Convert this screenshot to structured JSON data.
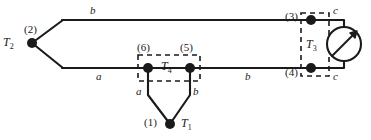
{
  "figure": {
    "width": 371,
    "height": 140,
    "colors": {
      "wire": "#1a1a1a",
      "dashed_box": "#1a1a1a",
      "node": "#1a1a1a",
      "background": "#ffffff"
    }
  },
  "nodes": [
    {
      "id": "n1",
      "number": "(1)",
      "temperature": "T",
      "temperature_sub": "1",
      "x": 170,
      "y": 124
    },
    {
      "id": "n2",
      "number": "(2)",
      "temperature": "T",
      "temperature_sub": "2",
      "x": 32,
      "y": 43
    },
    {
      "id": "n3",
      "number": "(3)",
      "temperature": "",
      "temperature_sub": "",
      "x": 311,
      "y": 20
    },
    {
      "id": "n4",
      "number": "(4)",
      "temperature": "",
      "temperature_sub": "",
      "x": 311,
      "y": 68
    },
    {
      "id": "n5",
      "number": "(5)",
      "temperature": "",
      "temperature_sub": "",
      "x": 190,
      "y": 68
    },
    {
      "id": "n6",
      "number": "(6)",
      "temperature": "",
      "temperature_sub": "",
      "x": 148,
      "y": 68
    }
  ],
  "node_labels": {
    "n1": "(1)",
    "n2": "(2)",
    "n3": "(3)",
    "n4": "(4)",
    "n5": "(5)",
    "n6": "(6)"
  },
  "temperature_labels": {
    "T1": "T",
    "T1_sub": "1",
    "T2": "T",
    "T2_sub": "2",
    "T3": "T",
    "T3_sub": "3",
    "T4": "T",
    "T4_sub": "4"
  },
  "wire_labels": {
    "top_main": "b",
    "bottom_left": "a",
    "bottom_mid": "b",
    "leg_left": "a",
    "leg_right": "b",
    "lead_top": "c",
    "lead_bottom": "c"
  },
  "isothermal_blocks": [
    {
      "id": "T4",
      "label": "T",
      "label_sub": "4",
      "x": 138,
      "y": 55,
      "w": 62,
      "h": 26
    },
    {
      "id": "T3",
      "label": "T",
      "label_sub": "3",
      "x": 301,
      "y": 14,
      "w": 28,
      "h": 62
    }
  ],
  "meter": {
    "name": "galvanometer",
    "symbol": "circle-with-diagonal-arrow",
    "cx": 344,
    "cy": 44,
    "r": 17
  }
}
